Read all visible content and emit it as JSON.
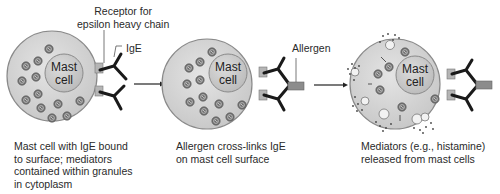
{
  "panels": [
    {
      "cell_label": [
        "Mast",
        "cell"
      ],
      "caption": "Mast cell with IgE bound\nto surface; mediators\ncontained within granules\nin cytoplasm",
      "annotations": {
        "receptor": "Receptor for\nepsilon heavy chain",
        "ige": "IgE"
      }
    },
    {
      "cell_label": [
        "Mast",
        "cell"
      ],
      "caption": "Allergen cross-links IgE\non mast cell surface",
      "annotations": {
        "allergen": "Allergen"
      }
    },
    {
      "cell_label": [
        "Mast",
        "cell"
      ],
      "caption": "Mediators (e.g., histamine)\nreleased from mast cells"
    }
  ],
  "colors": {
    "cytoplasm": "#d4d4d4",
    "nucleus": "#c8c8c8",
    "outline": "#8a8a8a",
    "granule": "#6e6e6e",
    "antibody": "#1a1a1a",
    "receptor": "#b0b0b0",
    "allergen": "#8c8c8c"
  }
}
